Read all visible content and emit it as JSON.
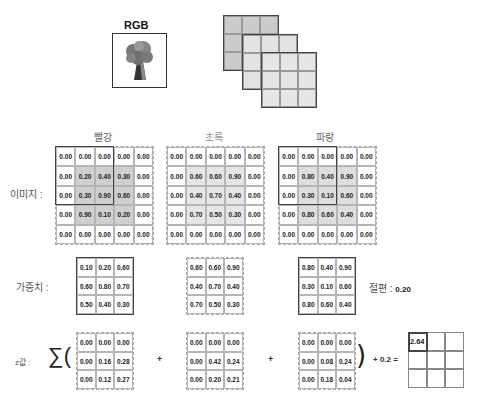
{
  "header": {
    "rgb_title": "RGB",
    "image_icon": "tree-image-icon"
  },
  "channels": [
    {
      "name": "빨강"
    },
    {
      "name": "초록"
    },
    {
      "name": "파랑"
    }
  ],
  "labels": {
    "image": "이미지 :",
    "weights": "가중치 :",
    "z": "z값 :",
    "bias_label": "절편 :",
    "bias_value": "0.20",
    "sum_symbol": "∑(",
    "close_paren": ")",
    "plus": "+",
    "bias_expr": "+ 0.2 ="
  },
  "image": {
    "red": [
      [
        "0.00",
        "0.00",
        "0.00",
        "0.00",
        "0.00"
      ],
      [
        "0.00",
        "0.20",
        "0.40",
        "0.30",
        "0.00"
      ],
      [
        "0.00",
        "0.30",
        "0.90",
        "0.60",
        "0.00"
      ],
      [
        "0.00",
        "0.90",
        "0.10",
        "0.20",
        "0.00"
      ],
      [
        "0.00",
        "0.00",
        "0.00",
        "0.00",
        "0.00"
      ]
    ],
    "green": [
      [
        "0.00",
        "0.00",
        "0.00",
        "0.00",
        "0.00"
      ],
      [
        "0.00",
        "0.60",
        "0.60",
        "0.90",
        "0.00"
      ],
      [
        "0.00",
        "0.40",
        "0.70",
        "0.40",
        "0.00"
      ],
      [
        "0.00",
        "0.70",
        "0.50",
        "0.30",
        "0.00"
      ],
      [
        "0.00",
        "0.00",
        "0.00",
        "0.00",
        "0.00"
      ]
    ],
    "blue": [
      [
        "0.00",
        "0.00",
        "0.00",
        "0.00",
        "0.00"
      ],
      [
        "0.00",
        "0.80",
        "0.40",
        "0.90",
        "0.00"
      ],
      [
        "0.00",
        "0.30",
        "0.10",
        "0.60",
        "0.00"
      ],
      [
        "0.00",
        "0.80",
        "0.60",
        "0.40",
        "0.00"
      ],
      [
        "0.00",
        "0.00",
        "0.00",
        "0.00",
        "0.00"
      ]
    ]
  },
  "weights": {
    "red": [
      [
        "0.10",
        "0.20",
        "0.60"
      ],
      [
        "0.60",
        "0.80",
        "0.70"
      ],
      [
        "0.50",
        "0.40",
        "0.30"
      ]
    ],
    "green": [
      [
        "0.60",
        "0.60",
        "0.90"
      ],
      [
        "0.40",
        "0.70",
        "0.40"
      ],
      [
        "0.70",
        "0.50",
        "0.30"
      ]
    ],
    "blue": [
      [
        "0.80",
        "0.40",
        "0.90"
      ],
      [
        "0.30",
        "0.10",
        "0.60"
      ],
      [
        "0.80",
        "0.60",
        "0.40"
      ]
    ]
  },
  "products": {
    "red": [
      [
        "0.00",
        "0.00",
        "0.00"
      ],
      [
        "0.00",
        "0.16",
        "0.28"
      ],
      [
        "0.00",
        "0.12",
        "0.27"
      ]
    ],
    "green": [
      [
        "0.00",
        "0.00",
        "0.00"
      ],
      [
        "0.00",
        "0.42",
        "0.24"
      ],
      [
        "0.00",
        "0.20",
        "0.21"
      ]
    ],
    "blue": [
      [
        "0.00",
        "0.00",
        "0.00"
      ],
      [
        "0.00",
        "0.08",
        "0.24"
      ],
      [
        "0.00",
        "0.18",
        "0.04"
      ]
    ]
  },
  "result": [
    [
      "2.64",
      "",
      ""
    ],
    [
      "",
      "",
      ""
    ],
    [
      "",
      "",
      ""
    ]
  ],
  "colors": {
    "red_shade": "#cfcfcf",
    "green_shade": "#e6e6e6",
    "blue_shade": "#dedede"
  }
}
